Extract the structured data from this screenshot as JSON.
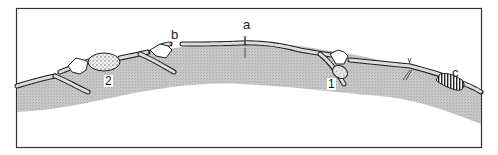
{
  "figure": {
    "frame_color": "#333333",
    "tissue_color": "#c4c4c4",
    "fiber_color": "#333333",
    "cell_fill": "#ffffff",
    "labels": {
      "a": "a",
      "b": "b",
      "c": "c",
      "n1": "1",
      "n2": "2"
    }
  }
}
